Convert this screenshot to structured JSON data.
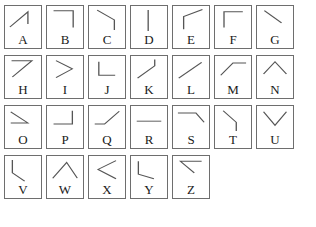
{
  "sheet": {
    "title": "Line-segment glyph chart A to Z",
    "columns_per_row": 7,
    "stroke_color": "#555555",
    "border_color": "#6e6e6e",
    "label_color": "#1a1a1a",
    "background_color": "#ffffff"
  },
  "rows": [
    {
      "cells": [
        {
          "label": "A",
          "glyph": "diagonal-up-right-then-vertical-down",
          "points": "12,72 56,20 56,62"
        },
        {
          "label": "B",
          "glyph": "horizontal-top-then-vertical-down",
          "points": "16,16 64,16 64,74"
        },
        {
          "label": "C",
          "glyph": "diagonal-down-right-then-vertical-down",
          "points": "20,14 62,48 62,82"
        },
        {
          "label": "D",
          "glyph": "vertical-line-center",
          "points": "42,14 42,86"
        },
        {
          "label": "E",
          "glyph": "vertical-up-then-diagonal-up-right",
          "points": "26,80 26,36 72,12"
        },
        {
          "label": "F",
          "glyph": "vertical-down-then-horizontal-top-right",
          "points": "22,74 22,20 68,20"
        },
        {
          "label": "G",
          "glyph": "diagonal-down-right-then-vertical",
          "points": "18,16 60,58 60,58"
        }
      ]
    },
    {
      "cells": [
        {
          "label": "H",
          "glyph": "horizontal-top-then-diagonal-down-left",
          "points": "16,16 66,16 18,72"
        },
        {
          "label": "I",
          "glyph": "chevron-right",
          "points": "22,16 62,44 22,74"
        },
        {
          "label": "J",
          "glyph": "vertical-then-horizontal-bottom-right",
          "points": "24,20 24,66 64,66"
        },
        {
          "label": "K",
          "glyph": "diagonal-up-right-then-vertical-up",
          "points": "16,76 58,34 58,12"
        },
        {
          "label": "L",
          "glyph": "diagonal-up-right",
          "points": "14,76 70,22"
        },
        {
          "label": "M",
          "glyph": "diagonal-up-right-then-horizontal",
          "points": "14,66 44,24 76,24"
        },
        {
          "label": "N",
          "glyph": "caret-up",
          "points": "16,62 44,20 72,62"
        }
      ]
    },
    {
      "cells": [
        {
          "label": "O",
          "glyph": "diagonal-down-right-then-horizontal",
          "points": "14,20 56,58 14,58"
        },
        {
          "label": "P",
          "glyph": "horizontal-then-vertical-up-right",
          "points": "16,62 62,62 62,16"
        },
        {
          "label": "Q",
          "glyph": "horizontal-then-diagonal-up-right",
          "points": "14,62 38,62 74,18"
        },
        {
          "label": "R",
          "glyph": "horizontal-line",
          "points": "14,52 74,52"
        },
        {
          "label": "S",
          "glyph": "horizontal-then-diagonal-down-right",
          "points": "12,24 56,24 76,56"
        },
        {
          "label": "T",
          "glyph": "diagonal-down-right-then-vertical-down",
          "points": "20,16 52,56 52,86"
        },
        {
          "label": "U",
          "glyph": "v-shape",
          "points": "16,20 44,66 72,20"
        }
      ]
    },
    {
      "cells": [
        {
          "label": "V",
          "glyph": "vertical-then-diagonal-down-right",
          "points": "18,14 18,58 48,86"
        },
        {
          "label": "W",
          "glyph": "diagonal-up-right-then-diagonal-down-right",
          "points": "14,76 48,22 74,76"
        },
        {
          "label": "X",
          "glyph": "chevron-left",
          "points": "66,16 22,46 66,78"
        },
        {
          "label": "Y",
          "glyph": "short-diagonal-then-vertical-bottom",
          "points": "18,18 18,62 56,78"
        },
        {
          "label": "Z",
          "glyph": "horizontal-then-diagonal-down-left",
          "points": "70,18 18,18 52,58"
        }
      ]
    }
  ]
}
